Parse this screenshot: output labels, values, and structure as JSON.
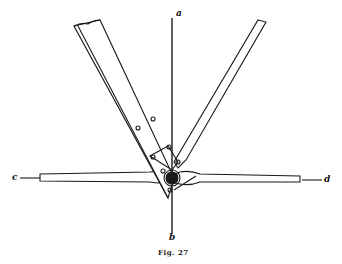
{
  "figure": {
    "caption": "Fig. 27",
    "labels": {
      "a": "a",
      "b": "b",
      "c": "c",
      "d": "d"
    },
    "colors": {
      "ink": "#1a1a1a",
      "paper": "#ffffff"
    }
  }
}
